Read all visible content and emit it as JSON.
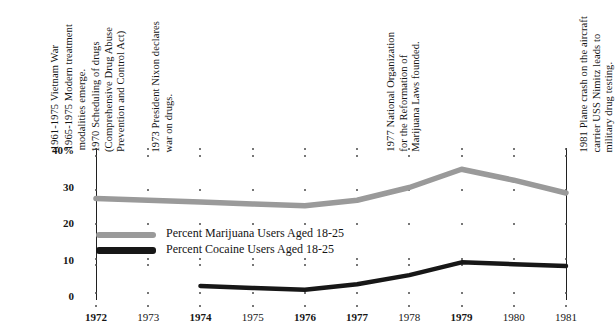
{
  "chart_data": {
    "type": "line",
    "title": "",
    "xlabel": "",
    "ylabel": "",
    "x": [
      1972,
      1973,
      1974,
      1975,
      1976,
      1977,
      1978,
      1979,
      1980,
      1981
    ],
    "xticklabels": [
      "1972",
      "1973",
      "1974",
      "1975",
      "1976",
      "1977",
      "1978",
      "1979",
      "1980",
      "1981"
    ],
    "yticklabels": [
      "40%",
      "30",
      "20",
      "10",
      "0"
    ],
    "yticks": [
      40,
      30,
      20,
      10,
      0
    ],
    "ylim": [
      0,
      40
    ],
    "grid": false,
    "legend_position": "center-left-inside",
    "series": [
      {
        "name": "Percent Marijuana Users Aged 18-25",
        "color": "#9a9a9a",
        "x": [
          1972,
          1973,
          1974,
          1975,
          1976,
          1977,
          1978,
          1979,
          1980,
          1981
        ],
        "values": [
          27.0,
          26.5,
          26.0,
          25.5,
          25.0,
          26.5,
          30.0,
          35.0,
          32.0,
          28.5
        ]
      },
      {
        "name": "Percent Cocaine Users Aged 18-25",
        "color": "#171717",
        "x": [
          1974,
          1975,
          1976,
          1977,
          1978,
          1979,
          1980,
          1981
        ],
        "values": [
          3.0,
          2.5,
          2.0,
          3.5,
          6.0,
          9.5,
          9.0,
          8.5
        ]
      }
    ],
    "annotations": [
      {
        "name": "vietnam-war",
        "text": "1961-1975 Vietnam War",
        "x_px": 49,
        "bottom_px": 150
      },
      {
        "name": "treatment-modalities",
        "text": "1965-1975 Modern treatment\nmodalities emerge.",
        "x_px": 63,
        "bottom_px": 150
      },
      {
        "name": "drug-scheduling",
        "text": "1970 Scheduling of drugs\n(Comprehensive Drug Abuse\nPrevention and Control Act)",
        "x_px": 90,
        "bottom_px": 152
      },
      {
        "name": "nixon-war-on-drugs",
        "text": "1973 President Nixon declares\nwar on drugs.",
        "x_px": 150,
        "bottom_px": 152
      },
      {
        "name": "norml-founded",
        "text": "1977 National Organization\nfor the Reformation of\nMarijuana Laws founded.",
        "x_px": 385,
        "bottom_px": 152
      },
      {
        "name": "uss-nimitz-crash",
        "text": "1981 Plane crash on the aircraft\ncarrier USS Nimitz leads to\nmilitary drug testing.",
        "x_px": 578,
        "bottom_px": 152
      }
    ]
  }
}
